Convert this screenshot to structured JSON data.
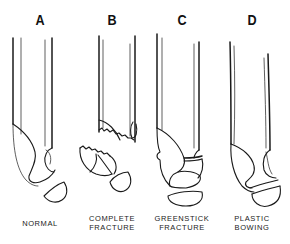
{
  "figure": {
    "panels": [
      {
        "letter": "A",
        "caption_lines": [
          "NORMAL"
        ],
        "icon": "normal-bone-icon"
      },
      {
        "letter": "B",
        "caption_lines": [
          "COMPLETE",
          "FRACTURE"
        ],
        "icon": "complete-fracture-bone-icon"
      },
      {
        "letter": "C",
        "caption_lines": [
          "GREENSTICK",
          "FRACTURE"
        ],
        "icon": "greenstick-fracture-bone-icon"
      },
      {
        "letter": "D",
        "caption_lines": [
          "PLASTIC",
          "BOWING"
        ],
        "icon": "plastic-bowing-bone-icon"
      }
    ]
  }
}
